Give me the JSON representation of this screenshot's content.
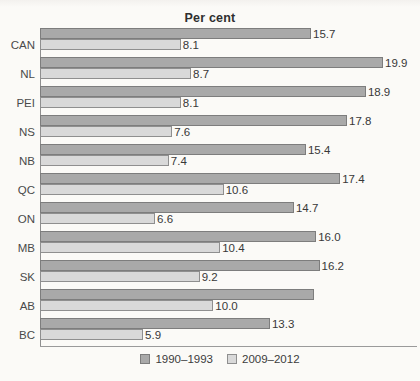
{
  "colors": {
    "bar_dark_fill": "#a9a9a9",
    "bar_dark_border": "#7d7d7d",
    "bar_light_fill": "#d9d9d9",
    "bar_light_border": "#8f8f8f",
    "axis_line": "#8f8f8f",
    "baseline": "#9a9a9a",
    "background": "#fbfaf7",
    "text": "#3c3c3c"
  },
  "chart_data": {
    "type": "bar",
    "orientation": "horizontal",
    "title": "Per cent",
    "xlabel": "",
    "ylabel": "",
    "xlim": [
      0,
      22
    ],
    "grid": false,
    "legend_position": "bottom-center",
    "categories": [
      "CAN",
      "NL",
      "PEI",
      "NS",
      "NB",
      "QC",
      "ON",
      "MB",
      "SK",
      "AB",
      "BC"
    ],
    "series": [
      {
        "name": "1990–1993",
        "values": [
          15.7,
          19.9,
          18.9,
          17.8,
          15.4,
          17.4,
          14.7,
          16.0,
          16.2,
          15.9,
          13.3
        ],
        "labels": [
          "15.7",
          "19.9",
          "18.9",
          "17.8",
          "15.4",
          "17.4",
          "14.7",
          "16.0",
          "16.2",
          "",
          "13.3"
        ]
      },
      {
        "name": "2009–2012",
        "values": [
          8.1,
          8.7,
          8.1,
          7.6,
          7.4,
          10.6,
          6.6,
          10.4,
          9.2,
          10.0,
          5.9
        ],
        "labels": [
          "8.1",
          "8.7",
          "8.1",
          "7.6",
          "7.4",
          "10.6",
          "6.6",
          "10.4",
          "9.2",
          "10.0",
          "5.9"
        ]
      }
    ]
  }
}
